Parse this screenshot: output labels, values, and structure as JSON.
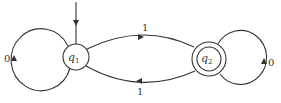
{
  "diagram": {
    "type": "finite-automaton",
    "start_state": "q1",
    "states": [
      {
        "id": "q1",
        "name": "q",
        "subscript": "1",
        "accepting": false,
        "start": true
      },
      {
        "id": "q2",
        "name": "q",
        "subscript": "2",
        "accepting": true,
        "start": false
      }
    ],
    "transitions": [
      {
        "from": "q1",
        "to": "q1",
        "label": "0"
      },
      {
        "from": "q1",
        "to": "q2",
        "label": "1"
      },
      {
        "from": "q2",
        "to": "q1",
        "label": "1"
      },
      {
        "from": "q2",
        "to": "q2",
        "label": "0"
      }
    ],
    "colors": {
      "stroke": "#333333",
      "background": "#ffffff"
    }
  }
}
